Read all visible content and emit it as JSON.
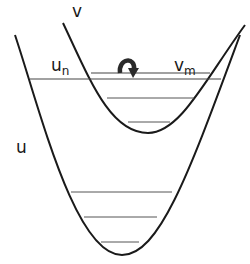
{
  "diagram": {
    "type": "potential-energy-curves",
    "colors": {
      "curve": "#1a1a1a",
      "level": "#444444",
      "arrow": "#2a2a2a",
      "background": "#ffffff"
    },
    "labels": {
      "upper_curve": "v",
      "lower_curve": "u",
      "lower_level": {
        "base": "u",
        "sub": "n"
      },
      "upper_level": {
        "base": "v",
        "sub": "m"
      }
    },
    "curves": [
      {
        "name": "u",
        "description": "lower (ground-state) potential well",
        "levels": 4
      },
      {
        "name": "v",
        "description": "upper (displaced) potential well",
        "levels": 3
      }
    ],
    "transition": {
      "from": "u_n",
      "to": "v_m",
      "symbol": "curved-arrow"
    }
  }
}
